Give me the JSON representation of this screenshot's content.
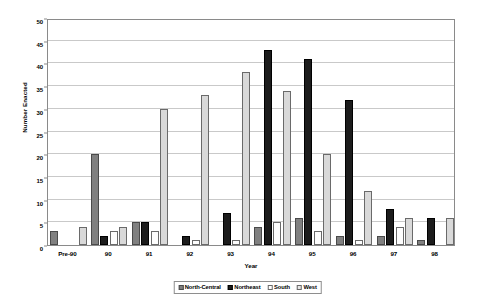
{
  "chart_data": {
    "type": "bar",
    "title": "",
    "xlabel": "Year",
    "ylabel": "Number Enacted",
    "ylim": [
      0,
      50
    ],
    "ytick_step": 5,
    "yticks": [
      0,
      5,
      10,
      15,
      20,
      25,
      30,
      35,
      40,
      45,
      50
    ],
    "grid": true,
    "legend_position": "bottom-center",
    "categories": [
      "Pre-90",
      "90",
      "91",
      "92",
      "93",
      "94",
      "95",
      "96",
      "97",
      "98"
    ],
    "series": [
      {
        "name": "North-Central",
        "color": "#808080",
        "values": [
          3,
          20,
          5,
          0,
          0,
          4,
          6,
          2,
          2,
          1
        ]
      },
      {
        "name": "Northeast",
        "color": "#1c1c1c",
        "values": [
          0,
          2,
          5,
          2,
          7,
          43,
          41,
          32,
          8,
          6
        ]
      },
      {
        "name": "South",
        "color": "#ffffff",
        "values": [
          0,
          3,
          3,
          1,
          1,
          5,
          3,
          1,
          4,
          0
        ]
      },
      {
        "name": "West",
        "color": "#d9d9d9",
        "values": [
          4,
          4,
          30,
          33,
          38,
          34,
          20,
          12,
          6,
          6
        ]
      }
    ]
  }
}
